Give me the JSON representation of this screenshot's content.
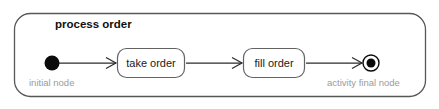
{
  "diagram": {
    "type": "uml-activity-diagram",
    "title": "process order",
    "frame": {
      "x": 14,
      "y": 13,
      "width": 412,
      "height": 84,
      "corner_radius": 16,
      "stroke_color": "#575757"
    },
    "nodes": [
      {
        "id": "initial",
        "kind": "initial-node",
        "annotation": "initial node",
        "cx": 52,
        "cy": 63,
        "r": 7.5,
        "color": "#0b0b0b"
      },
      {
        "id": "take-order",
        "kind": "action",
        "label": "take order",
        "x": 117,
        "y": 48,
        "width": 68,
        "height": 30,
        "corner_radius": 9,
        "stroke_color": "#636363"
      },
      {
        "id": "fill-order",
        "kind": "action",
        "label": "fill order",
        "x": 243,
        "y": 48,
        "width": 62,
        "height": 30,
        "corner_radius": 9,
        "stroke_color": "#636363"
      },
      {
        "id": "final",
        "kind": "activity-final-node",
        "annotation": "activity final node",
        "cx": 371,
        "cy": 63,
        "outer_r": 8.5,
        "inner_r": 4.5,
        "color": "#0b0b0b"
      }
    ],
    "edges": [
      {
        "id": "edge-1",
        "from": "initial",
        "to": "take-order",
        "x1": 59,
        "x2": 116,
        "y": 63
      },
      {
        "id": "edge-2",
        "from": "take-order",
        "to": "fill-order",
        "x1": 186,
        "x2": 242,
        "y": 63
      },
      {
        "id": "edge-3",
        "from": "fill-order",
        "to": "final",
        "x1": 306,
        "x2": 362,
        "y": 63
      }
    ],
    "annotations": [
      {
        "id": "initial-label",
        "text": "initial node",
        "x": 29,
        "y": 86,
        "color": "#9b9b9b"
      },
      {
        "id": "final-label",
        "text": "activity final node",
        "x": 327,
        "y": 86,
        "color": "#9b9b9b"
      }
    ],
    "title_position": {
      "x": 55,
      "y": 28
    }
  }
}
